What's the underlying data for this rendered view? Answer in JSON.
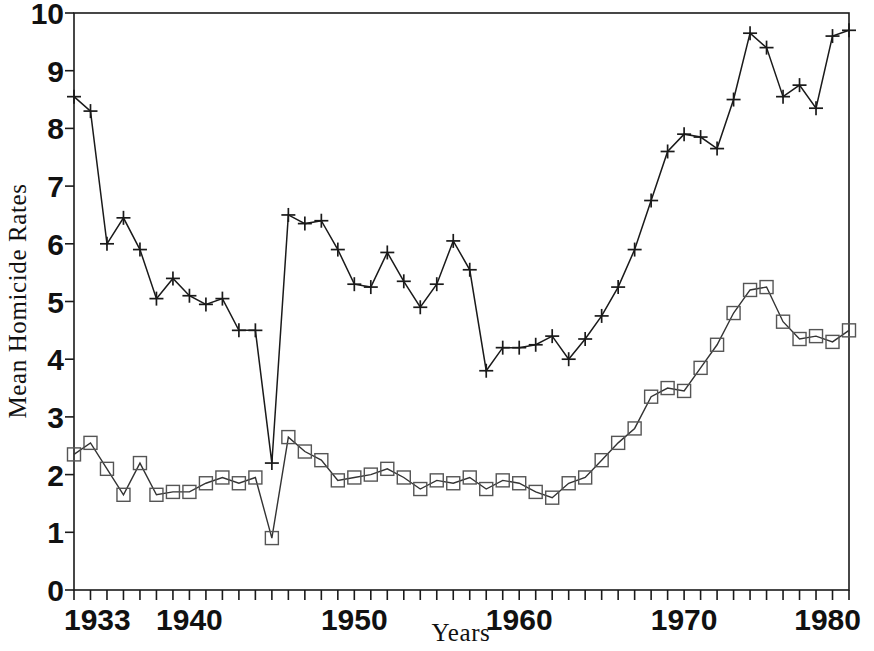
{
  "chart_data": {
    "type": "line",
    "title": "",
    "xlabel": "Years",
    "ylabel": "Mean Homicide Rates",
    "xlim": [
      1933,
      1980
    ],
    "ylim": [
      0,
      10
    ],
    "grid": false,
    "legend_position": "none",
    "x_tick_labels": [
      "1933",
      "1940",
      "1950",
      "1960",
      "1970",
      "1980"
    ],
    "x_tick_values": [
      1933,
      1940,
      1950,
      1960,
      1970,
      1980
    ],
    "x_minor_tick_interval": 1,
    "y_tick_labels": [
      "0",
      "1",
      "2",
      "3",
      "4",
      "5",
      "6",
      "7",
      "8",
      "9",
      "10"
    ],
    "y_tick_values": [
      0,
      1,
      2,
      3,
      4,
      5,
      6,
      7,
      8,
      9,
      10
    ],
    "x": [
      1933,
      1934,
      1935,
      1936,
      1937,
      1938,
      1939,
      1940,
      1941,
      1942,
      1943,
      1944,
      1945,
      1946,
      1947,
      1948,
      1949,
      1950,
      1951,
      1952,
      1953,
      1954,
      1955,
      1956,
      1957,
      1958,
      1959,
      1960,
      1961,
      1962,
      1963,
      1964,
      1965,
      1966,
      1967,
      1968,
      1969,
      1970,
      1971,
      1972,
      1973,
      1974,
      1975,
      1976,
      1977,
      1978,
      1979,
      1980
    ],
    "series": [
      {
        "name": "Upper series",
        "marker": "plus",
        "values": [
          8.55,
          8.3,
          6.0,
          6.45,
          5.9,
          5.05,
          5.4,
          5.1,
          4.95,
          5.05,
          4.5,
          4.5,
          2.2,
          6.5,
          6.35,
          6.4,
          5.9,
          5.3,
          5.25,
          5.85,
          5.35,
          4.9,
          5.3,
          6.05,
          5.55,
          3.8,
          4.2,
          4.2,
          4.25,
          4.4,
          4.0,
          4.35,
          4.75,
          5.25,
          5.9,
          6.75,
          7.6,
          7.9,
          7.85,
          7.65,
          8.5,
          9.65,
          9.4,
          8.55,
          8.75,
          8.35,
          9.6,
          9.7
        ]
      },
      {
        "name": "Lower series",
        "marker": "square",
        "values": [
          2.35,
          2.55,
          2.1,
          1.65,
          2.2,
          1.65,
          1.7,
          1.7,
          1.85,
          1.95,
          1.85,
          1.95,
          0.9,
          2.65,
          2.4,
          2.25,
          1.9,
          1.95,
          2.0,
          2.1,
          1.95,
          1.75,
          1.9,
          1.85,
          1.95,
          1.75,
          1.9,
          1.85,
          1.7,
          1.6,
          1.85,
          1.95,
          2.25,
          2.55,
          2.8,
          3.35,
          3.5,
          3.45,
          3.85,
          4.25,
          4.8,
          5.2,
          5.25,
          4.65,
          4.35,
          4.4,
          4.3,
          4.5
        ]
      }
    ]
  },
  "colors": {
    "axis": "#1a1a1a",
    "series_a": "#1a1a1a",
    "series_b": "#555555",
    "background": "#ffffff"
  }
}
